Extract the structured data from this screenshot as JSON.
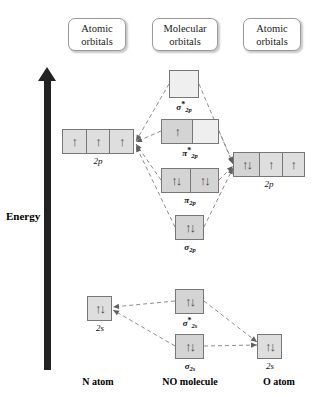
{
  "diagram": {
    "title_type": "molecular-orbital-energy-diagram",
    "molecule": "NO"
  },
  "headers": [
    {
      "line1": "Atomic",
      "line2": "orbitals",
      "x": 68,
      "y": 18,
      "w": 58,
      "h": 33
    },
    {
      "line1": "Molecular",
      "line2": "orbitals",
      "x": 152,
      "y": 18,
      "w": 66,
      "h": 33
    },
    {
      "line1": "Atomic",
      "line2": "orbitals",
      "x": 243,
      "y": 18,
      "w": 58,
      "h": 33
    }
  ],
  "energy_axis": {
    "label": "Energy",
    "bar": {
      "x": 44,
      "y": 80,
      "w": 7,
      "h": 290
    },
    "head": {
      "x": 38,
      "y": 67
    },
    "label_pos": {
      "x": 6,
      "y": 210
    },
    "color": "#222222"
  },
  "orbitals": [
    {
      "id": "sigma-2p-star",
      "label_greek": "σ",
      "label_star": "*",
      "label_sub": "2p",
      "x": 169,
      "y": 70,
      "w": 30,
      "h": 28,
      "label_x": 159,
      "label_y": 100,
      "label_w": 50,
      "cells": [
        {
          "fill": "empty",
          "electrons": 0
        }
      ]
    },
    {
      "id": "pi-2p-star",
      "label_greek": "π",
      "label_star": "*",
      "label_sub": "2p",
      "x": 161,
      "y": 119,
      "w": 58,
      "h": 25,
      "label_x": 165,
      "label_y": 146,
      "label_w": 50,
      "cells": [
        {
          "fill": "filled",
          "electrons": 1
        },
        {
          "fill": "empty",
          "electrons": 0
        }
      ]
    },
    {
      "id": "pi-2p",
      "label_greek": "π",
      "label_star": "",
      "label_sub": "2p",
      "x": 161,
      "y": 168,
      "w": 58,
      "h": 25,
      "label_x": 165,
      "label_y": 195,
      "label_w": 50,
      "cells": [
        {
          "fill": "filled",
          "electrons": 2
        },
        {
          "fill": "filled",
          "electrons": 2
        }
      ]
    },
    {
      "id": "sigma-2p",
      "label_greek": "σ",
      "label_star": "",
      "label_sub": "2p",
      "x": 175,
      "y": 215,
      "w": 29,
      "h": 25,
      "label_x": 165,
      "label_y": 242,
      "label_w": 50,
      "cells": [
        {
          "fill": "filled",
          "electrons": 2
        }
      ]
    },
    {
      "id": "sigma-2s-star",
      "label_greek": "σ",
      "label_star": "*",
      "label_sub": "2s",
      "x": 175,
      "y": 289,
      "w": 29,
      "h": 25,
      "label_x": 165,
      "label_y": 316,
      "label_w": 50,
      "cells": [
        {
          "fill": "filled",
          "electrons": 2
        }
      ]
    },
    {
      "id": "sigma-2s",
      "label_greek": "σ",
      "label_star": "",
      "label_sub": "2s",
      "x": 175,
      "y": 334,
      "w": 29,
      "h": 25,
      "label_x": 165,
      "label_y": 361,
      "label_w": 50,
      "cells": [
        {
          "fill": "filled",
          "electrons": 2
        }
      ]
    }
  ],
  "atomic_left": [
    {
      "id": "n-2p",
      "label": "2p",
      "x": 62,
      "y": 129,
      "w": 72,
      "h": 25,
      "label_x": 73,
      "label_y": 156,
      "label_w": 50,
      "cells": [
        {
          "fill": "half",
          "electrons": 1
        },
        {
          "fill": "half",
          "electrons": 1
        },
        {
          "fill": "half",
          "electrons": 1
        }
      ]
    },
    {
      "id": "n-2s",
      "label": "2s",
      "x": 87,
      "y": 296,
      "w": 25,
      "h": 25,
      "label_x": 75,
      "label_y": 323,
      "label_w": 50,
      "cells": [
        {
          "fill": "half",
          "electrons": 2
        }
      ]
    }
  ],
  "atomic_right": [
    {
      "id": "o-2p",
      "label": "2p",
      "x": 233,
      "y": 152,
      "w": 72,
      "h": 25,
      "label_x": 244,
      "label_y": 179,
      "label_w": 50,
      "cells": [
        {
          "fill": "filled",
          "electrons": 2
        },
        {
          "fill": "half",
          "electrons": 1
        },
        {
          "fill": "half",
          "electrons": 1
        }
      ]
    },
    {
      "id": "o-2s",
      "label": "2s",
      "x": 257,
      "y": 334,
      "w": 25,
      "h": 25,
      "label_x": 245,
      "label_y": 361,
      "label_w": 50,
      "cells": [
        {
          "fill": "half",
          "electrons": 2
        }
      ]
    }
  ],
  "captions": [
    {
      "text": "N atom",
      "x": 62,
      "y": 376,
      "w": 72
    },
    {
      "text": "NO molecule",
      "x": 145,
      "y": 376,
      "w": 90
    },
    {
      "text": "O atom",
      "x": 243,
      "y": 376,
      "w": 72
    }
  ],
  "links": [
    {
      "x1": 169,
      "y1": 84,
      "x2": 136,
      "y2": 141,
      "arrow": "end"
    },
    {
      "x1": 199,
      "y1": 84,
      "x2": 233,
      "y2": 164,
      "arrow": "end"
    },
    {
      "x1": 161,
      "y1": 131,
      "x2": 136,
      "y2": 142,
      "arrow": "end"
    },
    {
      "x1": 219,
      "y1": 131,
      "x2": 233,
      "y2": 163,
      "arrow": "end"
    },
    {
      "x1": 161,
      "y1": 180,
      "x2": 136,
      "y2": 144,
      "arrow": "end"
    },
    {
      "x1": 219,
      "y1": 180,
      "x2": 233,
      "y2": 166,
      "arrow": "end"
    },
    {
      "x1": 175,
      "y1": 227,
      "x2": 136,
      "y2": 146,
      "arrow": "end"
    },
    {
      "x1": 204,
      "y1": 227,
      "x2": 233,
      "y2": 168,
      "arrow": "end"
    },
    {
      "x1": 175,
      "y1": 301,
      "x2": 113,
      "y2": 307,
      "arrow": "end"
    },
    {
      "x1": 204,
      "y1": 301,
      "x2": 257,
      "y2": 342,
      "arrow": "end"
    },
    {
      "x1": 175,
      "y1": 346,
      "x2": 113,
      "y2": 310,
      "arrow": "end"
    },
    {
      "x1": 204,
      "y1": 346,
      "x2": 257,
      "y2": 345,
      "arrow": "end"
    }
  ],
  "symbols": {
    "up_arrow": "↑",
    "down_arrow": "↓"
  },
  "colors": {
    "box_border": "#777777",
    "cell_filled": "#d4d4d4",
    "cell_half": "#dedede",
    "cell_empty": "#efefef",
    "link": "#8d8d8d",
    "axis": "#222222",
    "text": "#111111"
  }
}
